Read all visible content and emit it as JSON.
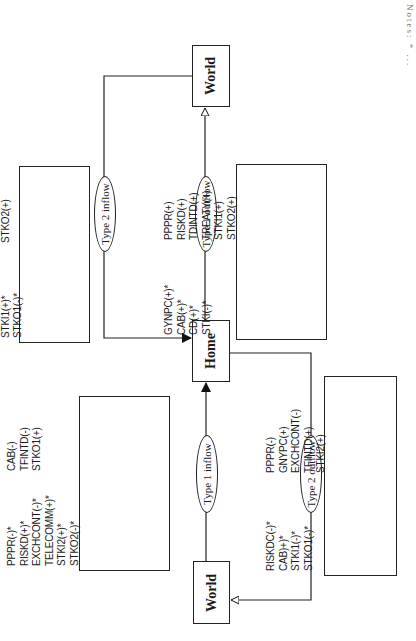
{
  "diagram": {
    "orientation": "rotated 90 degrees counter-clockwise",
    "nodes": {
      "world_top": "World",
      "home": "Home",
      "world_bottom": "World"
    },
    "flows": {
      "type2_inflow": {
        "label": "Type 2 inflow",
        "from": "World (top)",
        "to": "Home",
        "arrow": "filled",
        "variables_col1": [
          "PPPR(-)*",
          "CAB(-)*",
          "TELECOMM(+)*",
          "STKI1(+)*",
          "STKO1(-)*"
        ],
        "variables_col2": [
          "RISKDC(+)",
          "TDINTD(+)",
          "TREATY(+)",
          "STKO2(+)"
        ]
      },
      "type1_outflow": {
        "label": "Type 1 outflow",
        "from": "Home",
        "to": "World (top)",
        "arrow": "hollow",
        "variables_col1": [
          "GYNPC(+)*",
          "CAB(+)*",
          "CD(+)*",
          "STKI(-)*"
        ],
        "variables_col2": [
          "PPPR(+)",
          "RISKD(+)",
          "TDINTD(+)",
          "TREATY(+)",
          "STKI1(+)",
          "STKO2(+)"
        ]
      },
      "type1_inflow": {
        "label": "Type 1 inflow",
        "from": "World (bottom)",
        "to": "Home",
        "arrow": "filled",
        "variables_col1": [
          "PPPR(-)*",
          "RISKD(+)*",
          "EXCHCONT(-)*",
          "TELECOMM(+)*",
          "STKI2(+)*",
          "STKO2(-)*"
        ],
        "variables_col2": [
          "CAB(-)",
          "TFINTD(-)",
          "STKO1(+)"
        ]
      },
      "type2_outflow": {
        "label": "Type 2 outflow",
        "from": "Home",
        "to": "World (bottom)",
        "arrow": "hollow",
        "variables_col1": [
          "RISKDC(-)*",
          "CAB)+)*",
          "STKI1(-)*",
          "STKO1(-)*"
        ],
        "variables_col2": [
          "PPPR(-)",
          "GNYPC(+)",
          "EXCHCONT(-)",
          "TFINTD(+)",
          "STKI2(+)"
        ]
      }
    },
    "caption_partial": "Notes: * ..."
  }
}
